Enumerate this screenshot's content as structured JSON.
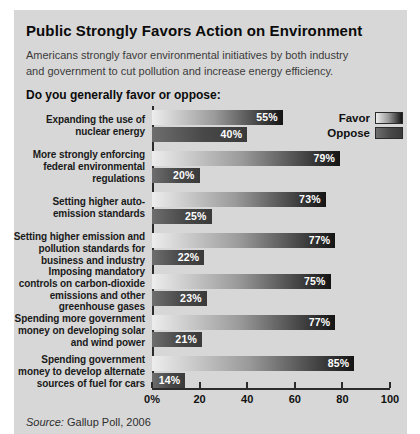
{
  "header": {
    "title": "Public Strongly Favors Action on Environment",
    "subtitle": "Americans strongly favor environmental initiatives by both industry\nand government to cut pollution and increase energy efficiency.",
    "question": "Do you generally favor or oppose:"
  },
  "legend": {
    "favor_label": "Favor",
    "oppose_label": "Oppose"
  },
  "source": {
    "label": "Source:",
    "text": " Gallup Poll, 2006"
  },
  "colors": {
    "panel_bg": "#d7d7d7",
    "favor_gradient_start": "#ededed",
    "favor_gradient_end": "#141414",
    "oppose_gradient_start": "#6e6e6e",
    "oppose_gradient_end": "#3a3a3a",
    "axis": "#2b2b2b",
    "value_label": "#ffffff"
  },
  "chart_data": {
    "type": "bar",
    "orientation": "horizontal",
    "title": "Public Strongly Favors Action on Environment",
    "categories": [
      "Expanding the use of\nnuclear energy",
      "More strongly enforcing\nfederal environmental\nregulations",
      "Setting higher auto-\nemission standards",
      "Setting higher emission and\npollution standards for\nbusiness and industry",
      "Imposing mandatory\ncontrols on carbon-dioxide\nemissions and other\ngreenhouse gases",
      "Spending more government\nmoney on developing solar\nand wind power",
      "Spending government\nmoney to develop alternate\nsources of fuel for cars"
    ],
    "series": [
      {
        "name": "Favor",
        "values": [
          55,
          79,
          73,
          77,
          75,
          77,
          85
        ]
      },
      {
        "name": "Oppose",
        "values": [
          40,
          20,
          25,
          22,
          23,
          21,
          14
        ]
      }
    ],
    "value_labels": {
      "favor": [
        "55%",
        "79%",
        "73%",
        "77%",
        "75%",
        "77%",
        "85%"
      ],
      "oppose": [
        "40%",
        "20%",
        "25%",
        "22%",
        "23%",
        "21%",
        "14%"
      ]
    },
    "xlim": [
      0,
      100
    ],
    "x_ticks": [
      "0%",
      "20",
      "40",
      "60",
      "80",
      "100"
    ],
    "x_tick_values": [
      0,
      20,
      40,
      60,
      80,
      100
    ],
    "grid": false,
    "legend_position": "top-right"
  }
}
